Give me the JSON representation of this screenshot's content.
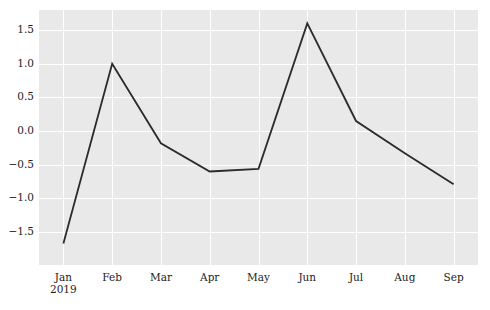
{
  "chart_data": {
    "type": "line",
    "title": "",
    "subtitle": "",
    "xlabel": "",
    "ylabel": "",
    "categories": [
      "Jan",
      "Feb",
      "Mar",
      "Apr",
      "May",
      "Jun",
      "Jul",
      "Aug",
      "Sep"
    ],
    "x_tick_sublabels": [
      "2019",
      "",
      "",
      "",
      "",
      "",
      "",
      "",
      ""
    ],
    "values": [
      -1.67,
      1.0,
      -0.18,
      -0.6,
      -0.56,
      1.6,
      0.15,
      -0.33,
      -0.79
    ],
    "series": [
      {
        "name": "series-1",
        "values": [
          -1.67,
          1.0,
          -0.18,
          -0.6,
          -0.56,
          1.6,
          0.15,
          -0.33,
          -0.79
        ]
      }
    ],
    "y_ticks": [
      1.5,
      1.0,
      0.5,
      0.0,
      -0.5,
      -1.0,
      -1.5
    ],
    "y_tick_labels": [
      "1.5",
      "1.0",
      "0.5",
      "0.0",
      "−0.5",
      "−1.0",
      "−1.5"
    ],
    "ylim": [
      -1.99,
      1.8
    ],
    "xlim": [
      -0.5,
      8.5
    ],
    "grid": true,
    "grid_color": "#ffffff",
    "plot_background": "#e9e9e9",
    "figure_background": "#ffffff",
    "line_color": "#2b2b2b",
    "line_width": 1.8,
    "legend": "none",
    "markers": "none"
  }
}
